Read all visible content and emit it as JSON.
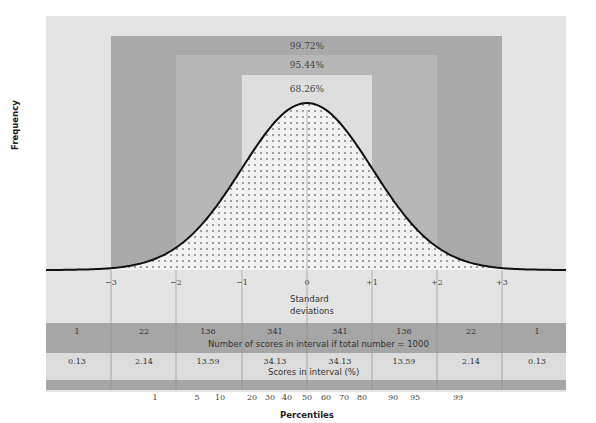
{
  "chart_data": {
    "type": "area",
    "title": "",
    "ylabel": "Frequency",
    "xlabel": "Percentiles",
    "x_axis_secondary_label": "Standard deviations",
    "sigma_ticks": [
      "−3",
      "−2",
      "−1",
      "0",
      "+1",
      "+2",
      "+3"
    ],
    "bands": [
      {
        "label": "68.26%",
        "from": -1,
        "to": 1
      },
      {
        "label": "95.44%",
        "from": -2,
        "to": 2
      },
      {
        "label": "99.72%",
        "from": -3,
        "to": 3
      }
    ],
    "intervals": [
      "< −3",
      "−3 to −2",
      "−2 to −1",
      "−1 to 0",
      "0 to +1",
      "+1 to +2",
      "+2 to +3",
      "> +3"
    ],
    "series": [
      {
        "name": "Number of scores in interval if total number = 1000",
        "values": [
          1,
          22,
          136,
          341,
          341,
          136,
          22,
          1
        ]
      },
      {
        "name": "Scores in interval (%)",
        "values": [
          0.13,
          2.14,
          13.59,
          34.13,
          34.13,
          13.59,
          2.14,
          0.13
        ]
      }
    ],
    "percentile_ticks": [
      1,
      5,
      10,
      20,
      30,
      40,
      50,
      60,
      70,
      80,
      90,
      95,
      99
    ],
    "legend": "none",
    "grid": false
  },
  "labels": {
    "frequency": "Frequency",
    "band_99": "99.72%",
    "band_95": "95.44%",
    "band_68": "68.26%",
    "std_dev_line1": "Standard",
    "std_dev_line2": "deviations",
    "count_caption": "Number of scores in interval if total number = 1000",
    "pct_caption": "Scores in interval (%)",
    "percentiles": "Percentiles"
  },
  "sigma": [
    "−3",
    "−2",
    "−1",
    "0",
    "+1",
    "+2",
    "+3"
  ],
  "counts": [
    "1",
    "22",
    "136",
    "341",
    "341",
    "136",
    "22",
    "1"
  ],
  "pcts": [
    "0.13",
    "2.14",
    "13.59",
    "34.13",
    "34.13",
    "13.59",
    "2.14",
    "0.13"
  ],
  "percentile_labels": [
    "1",
    "5",
    "10",
    "20",
    "30",
    "40",
    "50",
    "60",
    "70",
    "80",
    "90",
    "95",
    "99"
  ],
  "colors": {
    "panel": "#e4e4e4",
    "band_99": "#a9a9a9",
    "band_95": "#b7b7b7",
    "band_68": "#dedede",
    "curve": "#111111",
    "dots": "#8a8a8a"
  }
}
